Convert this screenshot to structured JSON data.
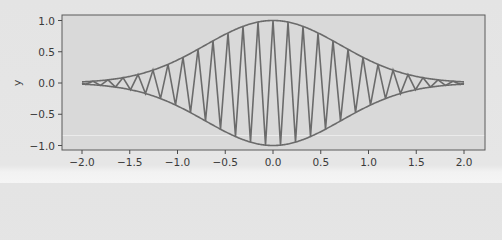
{
  "chart_data": {
    "type": "line",
    "title": "",
    "xlabel": "",
    "ylabel": "y",
    "xlim": [
      -2.2,
      2.2
    ],
    "ylim": [
      -1.1,
      1.1
    ],
    "grid": false,
    "legend": null,
    "xticks": [
      -2.0,
      -1.5,
      -1.0,
      -0.5,
      0.0,
      0.5,
      1.0,
      1.5,
      2.0
    ],
    "xtick_labels": [
      "−2.0",
      "−1.5",
      "−1.0",
      "−0.5",
      "0.0",
      "0.5",
      "1.0",
      "1.5",
      "2.0"
    ],
    "yticks": [
      1.0,
      0.5,
      0.0,
      -0.5,
      -1.0
    ],
    "ytick_labels": [
      "1.0",
      "0.5",
      "0.0",
      "−0.5",
      "−1.0"
    ],
    "series": [
      {
        "name": "signal",
        "formula": "exp(-x^2) * cos(40 x)",
        "x_range": [
          -2,
          2
        ],
        "color": "#6b6b6b"
      },
      {
        "name": "upper envelope",
        "formula": "exp(-x^2)",
        "x_range": [
          -2,
          2
        ],
        "color": "#6b6b6b"
      },
      {
        "name": "lower envelope",
        "formula": "-exp(-x^2)",
        "x_range": [
          -2,
          2
        ],
        "color": "#6b6b6b"
      }
    ],
    "sample_points": {
      "x": [
        -2.0,
        -1.5,
        -1.0,
        -0.5,
        0.0,
        0.5,
        1.0,
        1.5,
        2.0
      ],
      "envelope": [
        0.018,
        0.105,
        0.368,
        0.779,
        1.0,
        0.779,
        0.368,
        0.105,
        0.018
      ]
    }
  },
  "colors": {
    "plot_background": "#d9d9d9",
    "figure_background": "#e5e5e5",
    "line": "#6b6b6b",
    "frame": "#5a5a5a",
    "text": "#3a3a3a"
  }
}
